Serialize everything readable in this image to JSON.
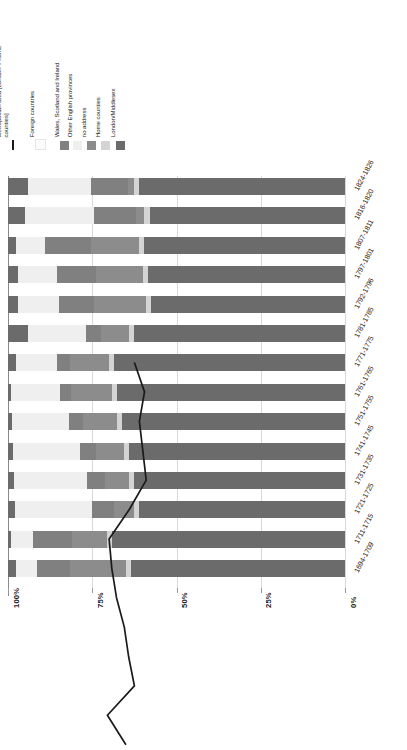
{
  "legend": {
    "items": [
      {
        "label": "Metropolitan area [London + home\ncounties]",
        "color": "#1a1a1a",
        "marker": "line"
      },
      {
        "label": "Foreign countries",
        "color": "#fbfbfb",
        "marker": "box"
      },
      {
        "label": "Wales, Scotland and Ireland",
        "color": "#808080",
        "marker": "box"
      },
      {
        "label": "Other English provinces",
        "color": "#efefef",
        "marker": "box"
      },
      {
        "label": "no address",
        "color": "#8c8c8c",
        "marker": "box"
      },
      {
        "label": "Home counties",
        "color": "#d4d4d4",
        "marker": "box"
      },
      {
        "label": "London/Middlesex",
        "color": "#6b6b6b",
        "marker": "box"
      }
    ]
  },
  "axis": {
    "ticks": [
      "100%",
      "75%",
      "50%",
      "25%",
      "0%"
    ],
    "tick_values": [
      100,
      75,
      50,
      25,
      0
    ],
    "reversed": true
  },
  "chart_data": {
    "type": "bar",
    "title": "",
    "subtitle": "",
    "xlabel": "",
    "ylabel": "",
    "orientation": "horizontal",
    "stacked": "100%",
    "xlim": [
      0,
      100
    ],
    "grid": true,
    "legend_position": "top-left",
    "categories": [
      "1824-1826",
      "1816-1820",
      "1807-1811",
      "1797-1801",
      "1792-1796",
      "1781-1785",
      "1771-1775",
      "1761-1765",
      "1751-1755",
      "1741-1745",
      "1731-1735",
      "1721-1725",
      "1711-1715",
      "1694-1709"
    ],
    "series": [
      {
        "name": "Foreign countries",
        "color": "#6b6b6b",
        "values": [
          6.0,
          5.0,
          2.5,
          3.0,
          3.0,
          6.0,
          2.5,
          0.8,
          1.2,
          1.5,
          1.8,
          2.0,
          1.0,
          2.5
        ]
      },
      {
        "name": "Other English provinces",
        "color": "#efefef",
        "values": [
          18.5,
          20.5,
          8.5,
          11.5,
          12.0,
          17.0,
          12.0,
          14.5,
          17.0,
          20.0,
          21.5,
          23.0,
          6.5,
          6.0
        ]
      },
      {
        "name": "Wales, Scotland and Ireland",
        "color": "#808080",
        "values": [
          11.0,
          12.5,
          13.5,
          11.5,
          10.5,
          4.5,
          4.0,
          3.5,
          4.0,
          4.5,
          5.5,
          6.5,
          11.5,
          10.0
        ]
      },
      {
        "name": "no address",
        "color": "#8c8c8c",
        "values": [
          2.0,
          2.5,
          14.5,
          14.0,
          15.5,
          8.5,
          11.5,
          12.0,
          10.0,
          8.5,
          7.0,
          6.0,
          10.5,
          16.5
        ]
      },
      {
        "name": "Home counties",
        "color": "#d4d4d4",
        "values": [
          1.5,
          1.5,
          1.5,
          1.5,
          1.5,
          1.5,
          1.5,
          1.5,
          1.5,
          1.5,
          1.5,
          1.5,
          1.5,
          1.5
        ]
      },
      {
        "name": "London/Middlesex",
        "color": "#6b6b6b",
        "values": [
          61.0,
          58.0,
          59.5,
          58.5,
          57.5,
          62.5,
          68.5,
          67.7,
          66.3,
          64.0,
          62.7,
          61.0,
          69.0,
          63.5
        ]
      }
    ],
    "line_series": {
      "name": "Metropolitan area [London + home counties]",
      "color": "#1a1a1a",
      "values": [
        62.5,
        59.5,
        61.0,
        60.0,
        59.0,
        64.0,
        70.0,
        69.2,
        67.8,
        65.5,
        64.2,
        62.5,
        70.5,
        65.0
      ]
    }
  }
}
